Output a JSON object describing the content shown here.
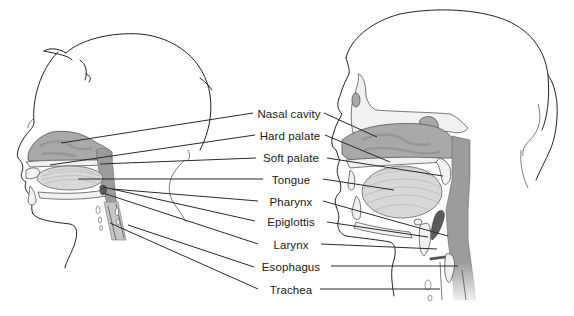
{
  "figure": {
    "type": "anatomical-diagram",
    "views": [
      {
        "name": "infant-head",
        "position": "left"
      },
      {
        "name": "adult-head",
        "position": "right"
      }
    ]
  },
  "labels": [
    {
      "id": "nasal-cavity",
      "text": "Nasal cavity",
      "x": 289,
      "y": 114
    },
    {
      "id": "hard-palate",
      "text": "Hard palate",
      "x": 290,
      "y": 136
    },
    {
      "id": "soft-palate",
      "text": "Soft palate",
      "x": 291,
      "y": 158
    },
    {
      "id": "tongue",
      "text": "Tongue",
      "x": 291,
      "y": 180
    },
    {
      "id": "pharynx",
      "text": "Pharynx",
      "x": 291,
      "y": 202
    },
    {
      "id": "epiglottis",
      "text": "Epiglottis",
      "x": 291,
      "y": 222
    },
    {
      "id": "larynx",
      "text": "Larynx",
      "x": 291,
      "y": 245
    },
    {
      "id": "esophagus",
      "text": "Esophagus",
      "x": 291,
      "y": 267
    },
    {
      "id": "trachea",
      "text": "Trachea",
      "x": 291,
      "y": 290
    }
  ],
  "leaders_left": [
    {
      "id": "nasal-cavity",
      "x1": 61,
      "y1": 143,
      "x2": 253,
      "y2": 113
    },
    {
      "id": "hard-palate",
      "x1": 50,
      "y1": 165,
      "x2": 255,
      "y2": 135
    },
    {
      "id": "soft-palate",
      "x1": 100,
      "y1": 164,
      "x2": 256,
      "y2": 158
    },
    {
      "id": "tongue",
      "x1": 78,
      "y1": 179,
      "x2": 263,
      "y2": 179
    },
    {
      "id": "pharynx",
      "x1": 112,
      "y1": 189,
      "x2": 258,
      "y2": 201
    },
    {
      "id": "epiglottis",
      "x1": 103,
      "y1": 187,
      "x2": 255,
      "y2": 221
    },
    {
      "id": "larynx",
      "x1": 103,
      "y1": 193,
      "x2": 258,
      "y2": 244
    },
    {
      "id": "esophagus",
      "x1": 128,
      "y1": 225,
      "x2": 254,
      "y2": 267
    },
    {
      "id": "trachea",
      "x1": 110,
      "y1": 223,
      "x2": 258,
      "y2": 289
    }
  ],
  "leaders_right": [
    {
      "id": "nasal-cavity",
      "x1": 324,
      "y1": 113,
      "x2": 377,
      "y2": 137
    },
    {
      "id": "hard-palate",
      "x1": 325,
      "y1": 135,
      "x2": 390,
      "y2": 162
    },
    {
      "id": "soft-palate",
      "x1": 327,
      "y1": 158,
      "x2": 443,
      "y2": 176
    },
    {
      "id": "tongue",
      "x1": 323,
      "y1": 179,
      "x2": 394,
      "y2": 190
    },
    {
      "id": "pharynx",
      "x1": 323,
      "y1": 201,
      "x2": 448,
      "y2": 236
    },
    {
      "id": "epiglottis",
      "x1": 327,
      "y1": 222,
      "x2": 428,
      "y2": 237
    },
    {
      "id": "larynx",
      "x1": 321,
      "y1": 244,
      "x2": 437,
      "y2": 249
    },
    {
      "id": "esophagus",
      "x1": 331,
      "y1": 266,
      "x2": 458,
      "y2": 266
    },
    {
      "id": "trachea",
      "x1": 320,
      "y1": 289,
      "x2": 440,
      "y2": 289
    }
  ],
  "caption": {
    "number": "",
    "text": "",
    "visible": "cropped at bottom edge"
  },
  "colors": {
    "background": "#ffffff",
    "outline": "#222222",
    "cavity_fill": "#a9a9a9",
    "tongue_fill": "#d8d8d8",
    "bone_fill": "#f1f1f1",
    "label_text": "#1a1a1a"
  }
}
